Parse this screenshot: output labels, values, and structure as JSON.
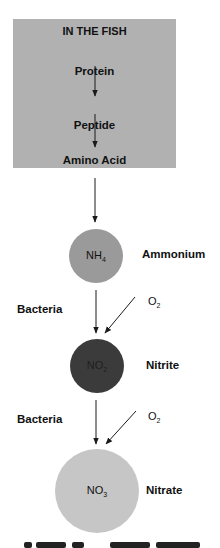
{
  "box": {
    "title": "IN THE FISH",
    "steps": [
      "Protein",
      "Peptide",
      "Amino Acid"
    ]
  },
  "compounds": [
    {
      "formula": "NH",
      "subscript": "4",
      "name": "Ammonium",
      "color": "#9a9a9a"
    },
    {
      "formula": "NO",
      "subscript": "2",
      "name": "Nitrite",
      "color": "#3b3b3b"
    },
    {
      "formula": "NO",
      "subscript": "3",
      "name": "Nitrate",
      "color": "#c6c6c6"
    }
  ],
  "transitions": [
    {
      "agent": "Bacteria",
      "input": "O",
      "input_subscript": "2"
    },
    {
      "agent": "Bacteria",
      "input": "O",
      "input_subscript": "2"
    }
  ],
  "colors": {
    "box": "#b1b1b1",
    "arrow": "#1a1a1a"
  }
}
